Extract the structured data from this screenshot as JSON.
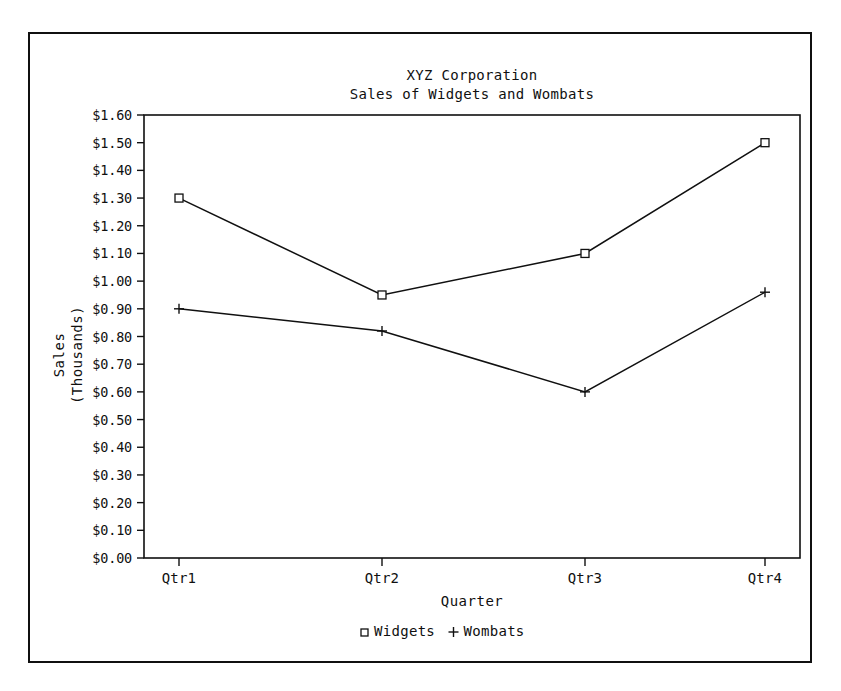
{
  "chart_data": {
    "type": "line",
    "title": "XYZ Corporation",
    "subtitle": "Sales of Widgets and Wombats",
    "xlabel": "Quarter",
    "ylabel_line1": "Sales",
    "ylabel_line2": "(Thousands)",
    "categories": [
      "Qtr1",
      "Qtr2",
      "Qtr3",
      "Qtr4"
    ],
    "series": [
      {
        "name": "Widgets",
        "marker": "square",
        "values": [
          1.3,
          0.95,
          1.1,
          1.5
        ]
      },
      {
        "name": "Wombats",
        "marker": "plus",
        "values": [
          0.9,
          0.82,
          0.6,
          0.96
        ]
      }
    ],
    "ylim": [
      0.0,
      1.6
    ],
    "ytick_step": 0.1,
    "ytick_labels": [
      "$1.60",
      "$1.50",
      "$1.40",
      "$1.30",
      "$1.20",
      "$1.10",
      "$1.00",
      "$0.90",
      "$0.80",
      "$0.70",
      "$0.60",
      "$0.50",
      "$0.40",
      "$0.30",
      "$0.20",
      "$0.10",
      "$0.00"
    ],
    "grid": false,
    "legend_position": "bottom",
    "legend_entries": [
      "Widgets",
      "Wombats"
    ],
    "colors": {
      "ink": "#101010",
      "background": "#ffffff"
    }
  }
}
